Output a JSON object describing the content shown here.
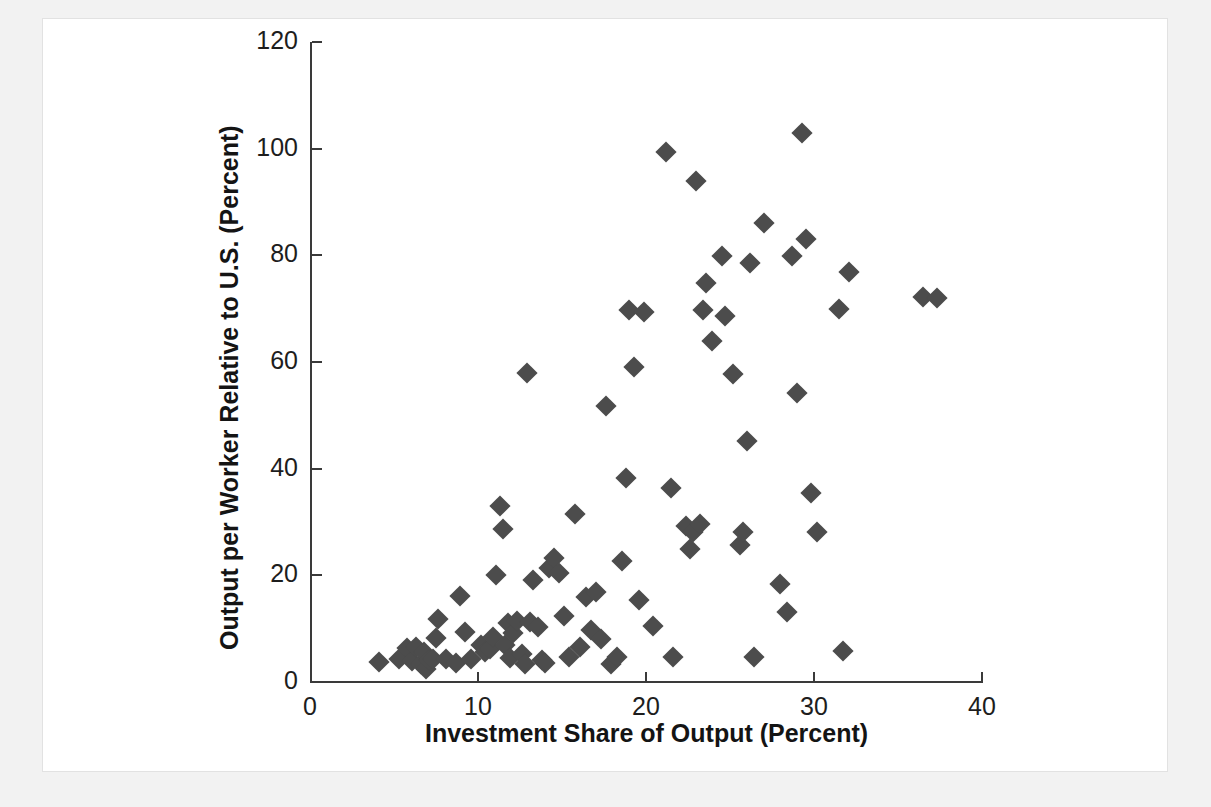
{
  "figure": {
    "background_color": "#ffffff",
    "mat_color": "#f2f2f2",
    "marker_color": "#4c4c4c",
    "axis_color": "#3a3a3a"
  },
  "chart_data": {
    "type": "scatter",
    "title": "",
    "xlabel": "Investment Share of Output (Percent)",
    "ylabel": "Output per Worker Relative to U.S. (Percent)",
    "xlim": [
      0,
      40
    ],
    "ylim": [
      0,
      120
    ],
    "xticks": [
      0,
      10,
      20,
      30,
      40
    ],
    "yticks": [
      0,
      20,
      40,
      60,
      80,
      100,
      120
    ],
    "xticklabels": [
      "0",
      "10",
      "20",
      "30",
      "40"
    ],
    "yticklabels": [
      "0",
      "20",
      "40",
      "60",
      "80",
      "100",
      "120"
    ],
    "grid": false,
    "legend": false,
    "legend_position": "none",
    "marker": "diamond",
    "series": [
      {
        "name": "Countries",
        "points": [
          [
            4.1,
            3.7
          ],
          [
            5.3,
            4.3
          ],
          [
            5.8,
            6.3
          ],
          [
            6.1,
            4.0
          ],
          [
            6.3,
            6.5
          ],
          [
            6.6,
            3.4
          ],
          [
            6.8,
            5.6
          ],
          [
            6.9,
            2.4
          ],
          [
            7.1,
            4.1
          ],
          [
            7.3,
            4.4
          ],
          [
            7.5,
            8.3
          ],
          [
            7.6,
            11.8
          ],
          [
            8.1,
            4.4
          ],
          [
            8.7,
            3.5
          ],
          [
            8.9,
            16.2
          ],
          [
            9.2,
            9.4
          ],
          [
            9.6,
            4.4
          ],
          [
            10.2,
            7.0
          ],
          [
            10.4,
            5.6
          ],
          [
            10.7,
            6.2
          ],
          [
            10.9,
            8.5
          ],
          [
            11.1,
            20.1
          ],
          [
            11.3,
            33.0
          ],
          [
            11.5,
            28.6
          ],
          [
            11.6,
            6.9
          ],
          [
            11.8,
            11.0
          ],
          [
            11.9,
            4.5
          ],
          [
            12.1,
            9.2
          ],
          [
            12.3,
            11.5
          ],
          [
            12.6,
            5.3
          ],
          [
            12.8,
            3.4
          ],
          [
            12.9,
            57.9
          ],
          [
            13.1,
            11.3
          ],
          [
            13.3,
            19.1
          ],
          [
            13.6,
            10.3
          ],
          [
            13.8,
            4.1
          ],
          [
            14.0,
            3.6
          ],
          [
            14.2,
            21.3
          ],
          [
            14.5,
            23.2
          ],
          [
            14.8,
            20.5
          ],
          [
            15.1,
            12.3
          ],
          [
            15.4,
            4.6
          ],
          [
            15.8,
            31.5
          ],
          [
            16.1,
            6.5
          ],
          [
            16.4,
            16.0
          ],
          [
            16.7,
            9.8
          ],
          [
            17.0,
            16.8
          ],
          [
            17.3,
            8.0
          ],
          [
            17.6,
            51.8
          ],
          [
            17.9,
            3.3
          ],
          [
            18.3,
            4.7
          ],
          [
            18.6,
            22.6
          ],
          [
            18.8,
            38.2
          ],
          [
            19.0,
            69.8
          ],
          [
            19.3,
            59.0
          ],
          [
            19.6,
            15.4
          ],
          [
            19.9,
            69.4
          ],
          [
            20.4,
            10.5
          ],
          [
            21.2,
            99.4
          ],
          [
            21.5,
            36.4
          ],
          [
            21.6,
            4.6
          ],
          [
            22.4,
            29.3
          ],
          [
            22.6,
            25.0
          ],
          [
            22.8,
            28.1
          ],
          [
            23.0,
            93.9
          ],
          [
            23.2,
            29.7
          ],
          [
            23.4,
            69.7
          ],
          [
            23.6,
            74.8
          ],
          [
            23.9,
            64.0
          ],
          [
            24.5,
            79.8
          ],
          [
            24.7,
            68.7
          ],
          [
            25.2,
            57.7
          ],
          [
            25.6,
            25.6
          ],
          [
            25.8,
            28.1
          ],
          [
            26.0,
            45.1
          ],
          [
            26.2,
            78.6
          ],
          [
            26.4,
            4.7
          ],
          [
            27.0,
            86.0
          ],
          [
            28.0,
            18.4
          ],
          [
            28.4,
            13.1
          ],
          [
            28.7,
            79.9
          ],
          [
            29.0,
            54.2
          ],
          [
            29.3,
            103.0
          ],
          [
            29.5,
            83.0
          ],
          [
            29.8,
            35.5
          ],
          [
            30.2,
            28.2
          ],
          [
            31.5,
            70.0
          ],
          [
            31.7,
            5.8
          ],
          [
            32.1,
            76.8
          ],
          [
            36.5,
            72.1
          ],
          [
            37.3,
            72.0
          ]
        ]
      }
    ]
  }
}
